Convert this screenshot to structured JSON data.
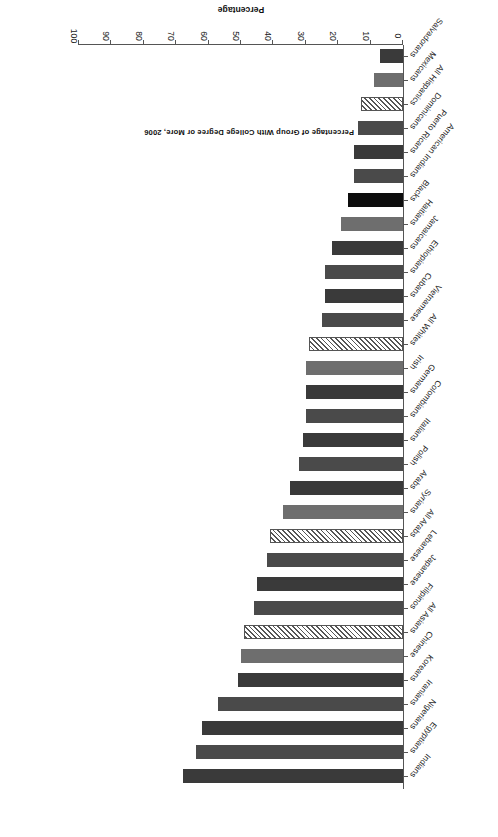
{
  "chart_data": {
    "type": "bar",
    "orientation": "horizontal",
    "title": "Percentage of Group With College Degree or More, 2006",
    "xlabel": "Percentage",
    "ylabel": "",
    "xlim": [
      0,
      100
    ],
    "xticks": [
      0,
      10,
      20,
      30,
      40,
      50,
      60,
      70,
      80,
      90,
      100
    ],
    "grid": false,
    "legend": "none",
    "rotation_note": "figure printed upside down (180 degrees)",
    "categories": [
      "Indians",
      "Egyptians",
      "Nigerians",
      "Iranians",
      "Koreans",
      "Chinese",
      "All Asians",
      "Filipinos",
      "Japanese",
      "Lebanese",
      "All Arabs",
      "Syrians",
      "Arabs",
      "Polish",
      "Italians",
      "Colombians",
      "Germans",
      "Irish",
      "All Whites",
      "Vietnamese",
      "Cubans",
      "Ethiopians",
      "Jamaicans",
      "Haitians",
      "Blacks",
      "American Indians",
      "Puerto Ricans",
      "Dominicans",
      "All Hispanics",
      "Mexicans",
      "Salvadorans"
    ],
    "values": [
      68,
      64,
      62,
      57,
      51,
      50,
      49,
      46,
      45,
      42,
      41,
      37,
      35,
      32,
      31,
      30,
      30,
      30,
      29,
      25,
      24,
      24,
      22,
      19,
      17,
      15,
      15,
      14,
      13,
      9,
      7
    ],
    "bar_styles": [
      "solid",
      "solid",
      "solid",
      "solid",
      "solid",
      "solid",
      "hatched",
      "solid",
      "solid",
      "solid",
      "hatched",
      "solid",
      "solid",
      "solid",
      "solid",
      "solid",
      "solid",
      "solid",
      "hatched",
      "solid",
      "solid",
      "solid",
      "solid",
      "solid",
      "solid-black",
      "solid",
      "solid",
      "solid",
      "hatched",
      "solid",
      "solid"
    ],
    "colors": {
      "bar_default": "#3a3a3a",
      "bar_mid": "#4a4a4a",
      "bar_light": "#6e6e6e",
      "bar_black": "#0d0d0d",
      "hatch_fill": "#ffffff",
      "hatch_line": "#555555",
      "axis": "#555555",
      "text": "#1a1a1a",
      "background": "#ffffff"
    }
  }
}
